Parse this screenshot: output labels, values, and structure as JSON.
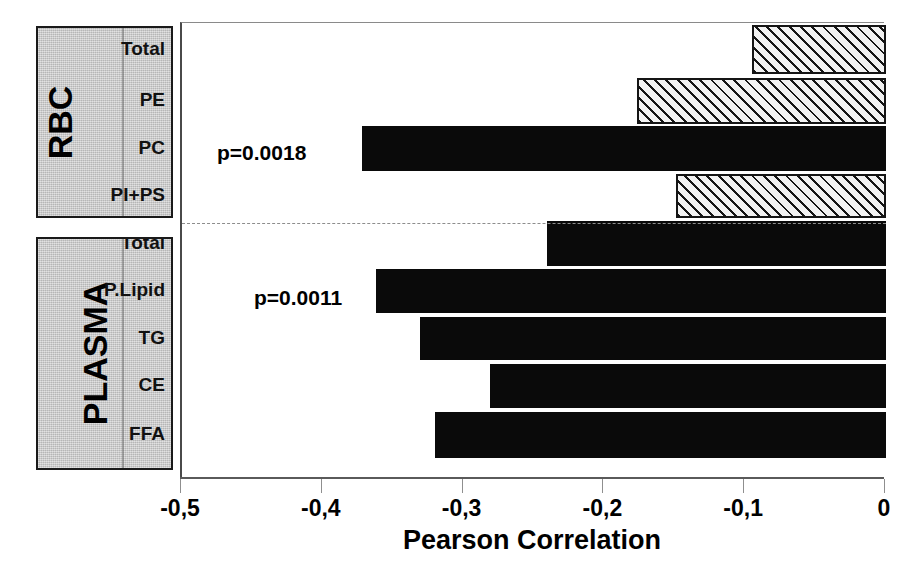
{
  "chart_data": {
    "type": "bar",
    "orientation": "horizontal",
    "title": "",
    "xlabel": "Pearson Correlation",
    "ylabel": "",
    "xlim": [
      -0.5,
      0
    ],
    "xticks": [
      -0.5,
      -0.4,
      -0.3,
      -0.2,
      -0.1,
      0
    ],
    "xtick_labels": [
      "-0,5",
      "-0,4",
      "-0,3",
      "-0,2",
      "-0,1",
      "0"
    ],
    "grid": false,
    "legend": "none",
    "groups": [
      {
        "name": "RBC",
        "categories": [
          "Total",
          "PE",
          "PC",
          "PI+PS"
        ],
        "values": [
          -0.095,
          -0.177,
          -0.372,
          -0.149
        ],
        "styles": [
          "hatched",
          "hatched",
          "solid",
          "hatched"
        ]
      },
      {
        "name": "PLASMA",
        "categories": [
          "Total",
          "P.Lipid",
          "TG",
          "CE",
          "FFA"
        ],
        "values": [
          -0.241,
          -0.362,
          -0.331,
          -0.281,
          -0.32
        ],
        "styles": [
          "solid",
          "solid",
          "solid",
          "solid",
          "solid"
        ]
      }
    ],
    "annotations": [
      {
        "text": "p=0.0018",
        "group": "RBC",
        "category": "PC"
      },
      {
        "text": "p=0.0011",
        "group": "PLASMA",
        "category": "P.Lipid"
      }
    ],
    "colors": {
      "solid_fill": "#0a0a0a",
      "hatched_fill": "#f2f2f2",
      "hatch_line": "#151515",
      "group_box_fill": "#c9c9c9",
      "axis": "#5a5a5a",
      "text": "#000000"
    }
  }
}
